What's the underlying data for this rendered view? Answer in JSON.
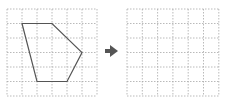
{
  "diagram": {
    "type": "grid-transformation",
    "grid": {
      "columns": 6,
      "rows": 6,
      "line_color": "#a8a8a8",
      "line_style": "dotted"
    },
    "left_grid": {
      "origin": [
        7,
        9
      ],
      "cell_w": 15,
      "cell_h": 14.5,
      "shape": {
        "type": "pentagon",
        "stroke": "#555555",
        "vertices_grid": [
          [
            1,
            1
          ],
          [
            3,
            1
          ],
          [
            5,
            3
          ],
          [
            4,
            5
          ],
          [
            2,
            5
          ]
        ]
      }
    },
    "arrow": {
      "direction": "right",
      "color": "#555555"
    },
    "right_grid": {
      "origin": [
        127,
        9
      ],
      "cell_w": 15.3,
      "cell_h": 14.5,
      "shape": null
    }
  }
}
